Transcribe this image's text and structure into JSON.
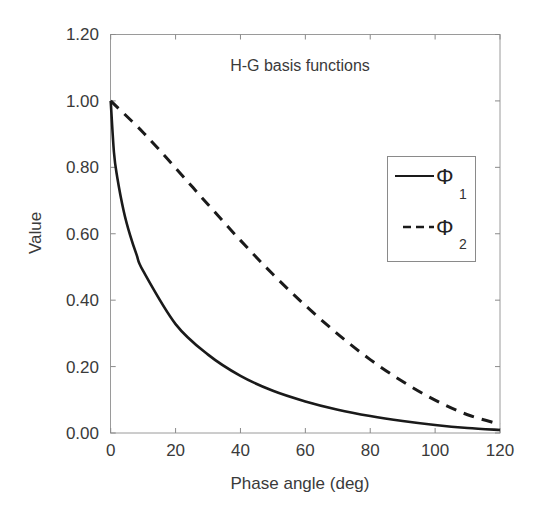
{
  "chart_data": {
    "type": "line",
    "title": "H-G basis functions",
    "xlabel": "Phase angle (deg)",
    "ylabel": "Value",
    "xlim": [
      0,
      120
    ],
    "ylim": [
      0,
      1.2
    ],
    "xticks": [
      "0",
      "20",
      "40",
      "60",
      "80",
      "100",
      "120"
    ],
    "yticks": [
      "0.00",
      "0.20",
      "0.40",
      "0.60",
      "0.80",
      "1.00",
      "1.20"
    ],
    "grid": false,
    "legend_position": "right-middle inside",
    "x": [
      0,
      10,
      20,
      30,
      40,
      50,
      60,
      70,
      80,
      90,
      100,
      110,
      120
    ],
    "series": [
      {
        "name": "Φ1",
        "symbol": "Φ",
        "subscript": "1",
        "style": "solid",
        "color": "#1a1a1a",
        "values": [
          1.0,
          0.488,
          0.328,
          0.236,
          0.172,
          0.127,
          0.095,
          0.07,
          0.051,
          0.036,
          0.024,
          0.015,
          0.009
        ]
      },
      {
        "name": "Φ2",
        "symbol": "Φ",
        "subscript": "2",
        "style": "dashed",
        "color": "#1a1a1a",
        "values": [
          1.0,
          0.905,
          0.798,
          0.688,
          0.58,
          0.478,
          0.384,
          0.298,
          0.221,
          0.155,
          0.099,
          0.055,
          0.026
        ]
      }
    ]
  }
}
